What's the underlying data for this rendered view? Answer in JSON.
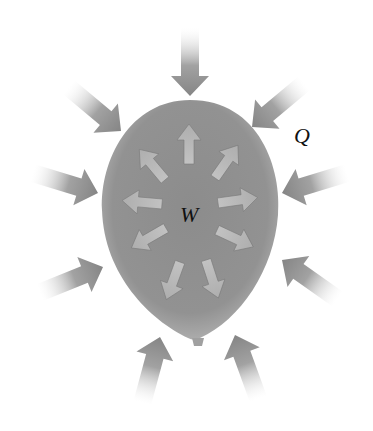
{
  "figure": {
    "labels": {
      "heat": "Q",
      "work": "W"
    },
    "colors": {
      "background": "#ffffff",
      "balloon": "#8e8e8e",
      "balloon_edge": "#a8a8a8",
      "outer_arrow": "#8a8a8a",
      "inner_arrow": "#b8b8b8",
      "label_text": "#111111"
    },
    "outer_arrows": {
      "count": 10,
      "direction": "inward",
      "meaning": "heat Q flowing into balloon"
    },
    "inner_arrows": {
      "count": 9,
      "direction": "outward",
      "meaning": "work W done by gas expanding"
    }
  }
}
